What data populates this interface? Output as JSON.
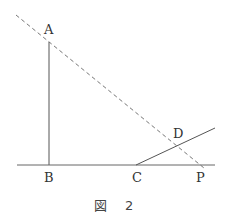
{
  "figure": {
    "caption_prefix": "図",
    "caption_number": "2",
    "points": {
      "A": {
        "label": "A",
        "x": 49,
        "y": 41
      },
      "B": {
        "label": "B",
        "x": 49,
        "y": 165
      },
      "C": {
        "label": "C",
        "x": 136,
        "y": 165
      },
      "D": {
        "label": "D",
        "x": 176,
        "y": 143
      },
      "P": {
        "label": "P",
        "x": 200,
        "y": 165
      }
    },
    "segments": [
      {
        "name": "AB",
        "style": "solid"
      },
      {
        "name": "baseline",
        "style": "solid"
      },
      {
        "name": "ray-CD",
        "style": "solid"
      },
      {
        "name": "line-AP",
        "style": "dashed"
      }
    ],
    "colors": {
      "line": "#555555",
      "dashed": "#777777",
      "text": "#333333"
    }
  }
}
